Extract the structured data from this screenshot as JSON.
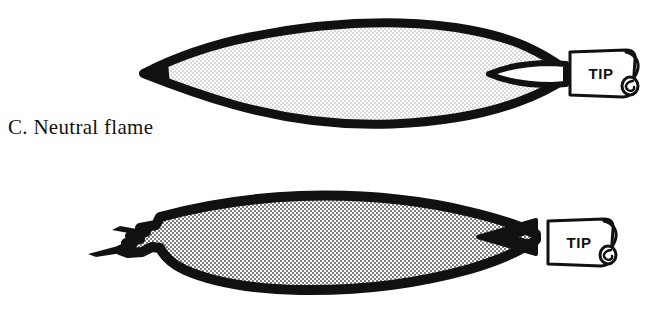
{
  "figure": {
    "background_color": "#ffffff",
    "ink_color": "#111111",
    "panels": [
      {
        "id": "neutral",
        "caption": "C. Neutral flame",
        "flame_name": "neutral-flame",
        "tip_label": "TIP",
        "envelope_fill": "#e9e9e9",
        "outline_color": "#111111",
        "inner_cone_fill": "#ffffff",
        "shape_note": "long pointed lens-shaped envelope with sharp left point and small white inner cone at torch tip"
      },
      {
        "id": "oxidizing",
        "caption": "D. Oxidizing flame",
        "flame_name": "oxidizing-flame",
        "tip_label": "TIP",
        "envelope_fill": "#b4b4b4",
        "outline_color": "#111111",
        "inner_cone_fill": "#111111",
        "shape_note": "blunt rounded envelope with ragged feathered left end and short sharp dark inner cone at torch tip"
      }
    ]
  }
}
